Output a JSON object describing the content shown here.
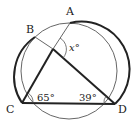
{
  "diagram": {
    "type": "circle-geometry",
    "points": {
      "A": {
        "label": "A"
      },
      "B": {
        "label": "B"
      },
      "C": {
        "label": "C"
      },
      "D": {
        "label": "D"
      }
    },
    "angles": {
      "C": {
        "label": "65°",
        "value": 65
      },
      "D": {
        "label": "39°",
        "value": 39
      },
      "x": {
        "label": "x°",
        "variable": "x",
        "unit": "°"
      }
    },
    "segments": [
      "AC",
      "BD",
      "CD"
    ],
    "colors": {
      "stroke": "#222222",
      "thin_stroke": "#555555",
      "background": "#ffffff"
    }
  }
}
